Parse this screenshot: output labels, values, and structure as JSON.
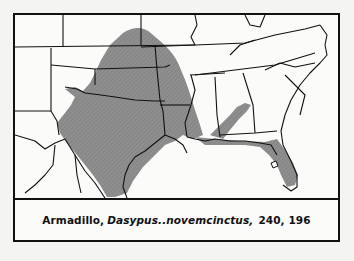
{
  "figure": {
    "caption": {
      "common_name": "Armadillo,",
      "scientific_name": "Dasypus..novemcinctus,",
      "page_refs": "240, 196"
    },
    "map": {
      "subject": "range-map",
      "region": "southeastern United States",
      "range_color": "#8a8a8a",
      "border_color": "#111111",
      "background_color": "#fbfbf9"
    }
  }
}
